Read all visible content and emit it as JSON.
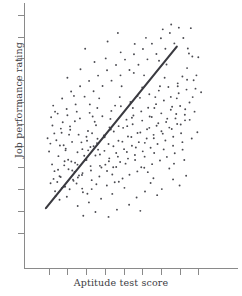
{
  "chart_data": {
    "type": "scatter",
    "title": "",
    "xlabel": "Aptitude test score",
    "ylabel": "Job performance rating",
    "grid": false,
    "legend": null,
    "xlim": [
      0,
      100
    ],
    "ylim": [
      0,
      100
    ],
    "xticks": [
      10,
      20,
      30,
      40,
      50,
      60,
      70,
      80,
      90
    ],
    "yticks": [
      8,
      17,
      26,
      35,
      44,
      53,
      62,
      71,
      80,
      89,
      98
    ],
    "xtick_labels": [],
    "ytick_labels": [],
    "n_points": 300,
    "correlation": 0.55,
    "trend_line": {
      "type": "linear-regression",
      "x_start": 8.5,
      "y_start": 18.1,
      "x_end": 78.5,
      "y_end": 84.9,
      "color": "#3a3a40"
    },
    "point_color": "#4a4a50",
    "axis_color": "#8a8a8a",
    "points": [
      [
        10.2,
        41.5
      ],
      [
        11.8,
        36.2
      ],
      [
        9.4,
        47.0
      ],
      [
        13.1,
        33.4
      ],
      [
        12.0,
        52.3
      ],
      [
        14.6,
        28.9
      ],
      [
        10.9,
        44.8
      ],
      [
        15.2,
        39.6
      ],
      [
        13.7,
        23.1
      ],
      [
        16.4,
        31.0
      ],
      [
        11.3,
        55.7
      ],
      [
        17.0,
        26.4
      ],
      [
        14.1,
        46.2
      ],
      [
        18.3,
        35.8
      ],
      [
        12.6,
        30.2
      ],
      [
        19.1,
        42.7
      ],
      [
        15.8,
        21.6
      ],
      [
        20.4,
        38.1
      ],
      [
        16.9,
        49.3
      ],
      [
        21.2,
        25.9
      ],
      [
        13.4,
        58.0
      ],
      [
        22.6,
        33.7
      ],
      [
        18.0,
        44.1
      ],
      [
        23.3,
        29.4
      ],
      [
        17.5,
        53.6
      ],
      [
        24.1,
        36.9
      ],
      [
        19.7,
        22.8
      ],
      [
        25.4,
        41.2
      ],
      [
        20.9,
        48.5
      ],
      [
        26.2,
        31.6
      ],
      [
        18.8,
        27.0
      ],
      [
        27.5,
        45.3
      ],
      [
        22.1,
        37.4
      ],
      [
        28.3,
        24.7
      ],
      [
        21.4,
        51.9
      ],
      [
        29.0,
        39.8
      ],
      [
        23.8,
        33.1
      ],
      [
        30.2,
        47.6
      ],
      [
        24.9,
        28.3
      ],
      [
        31.1,
        42.0
      ],
      [
        26.7,
        55.2
      ],
      [
        32.4,
        35.5
      ],
      [
        25.6,
        30.8
      ],
      [
        33.2,
        49.1
      ],
      [
        27.9,
        26.2
      ],
      [
        34.0,
        43.7
      ],
      [
        29.4,
        38.0
      ],
      [
        35.3,
        52.4
      ],
      [
        28.1,
        32.6
      ],
      [
        36.1,
        46.8
      ],
      [
        30.7,
        24.1
      ],
      [
        37.4,
        40.3
      ],
      [
        31.9,
        57.5
      ],
      [
        38.2,
        34.9
      ],
      [
        33.0,
        29.7
      ],
      [
        39.5,
        48.2
      ],
      [
        32.3,
        43.4
      ],
      [
        40.3,
        36.1
      ],
      [
        34.6,
        53.8
      ],
      [
        41.1,
        27.5
      ],
      [
        35.8,
        45.0
      ],
      [
        42.4,
        38.7
      ],
      [
        37.1,
        31.2
      ],
      [
        43.2,
        50.6
      ],
      [
        36.4,
        42.3
      ],
      [
        44.5,
        35.0
      ],
      [
        38.7,
        56.1
      ],
      [
        45.3,
        28.8
      ],
      [
        39.9,
        47.4
      ],
      [
        46.1,
        40.9
      ],
      [
        41.2,
        33.5
      ],
      [
        47.4,
        52.0
      ],
      [
        42.0,
        44.6
      ],
      [
        48.2,
        37.2
      ],
      [
        43.5,
        58.3
      ],
      [
        49.5,
        30.4
      ],
      [
        44.8,
        49.8
      ],
      [
        50.3,
        42.5
      ],
      [
        46.1,
        35.1
      ],
      [
        51.6,
        54.7
      ],
      [
        47.3,
        46.0
      ],
      [
        52.4,
        38.6
      ],
      [
        48.6,
        60.2
      ],
      [
        53.2,
        31.9
      ],
      [
        49.8,
        51.3
      ],
      [
        54.5,
        43.9
      ],
      [
        51.1,
        36.5
      ],
      [
        55.3,
        56.4
      ],
      [
        52.4,
        47.7
      ],
      [
        56.1,
        40.1
      ],
      [
        53.7,
        62.0
      ],
      [
        57.4,
        33.3
      ],
      [
        54.9,
        52.8
      ],
      [
        58.2,
        45.4
      ],
      [
        56.2,
        38.0
      ],
      [
        59.5,
        58.1
      ],
      [
        57.5,
        49.2
      ],
      [
        60.3,
        41.6
      ],
      [
        58.8,
        63.7
      ],
      [
        61.1,
        34.8
      ],
      [
        60.0,
        54.3
      ],
      [
        62.4,
        46.9
      ],
      [
        61.3,
        39.4
      ],
      [
        63.2,
        59.6
      ],
      [
        62.6,
        50.7
      ],
      [
        64.5,
        43.1
      ],
      [
        63.8,
        65.2
      ],
      [
        65.3,
        36.3
      ],
      [
        65.1,
        55.8
      ],
      [
        66.1,
        48.4
      ],
      [
        66.4,
        40.9
      ],
      [
        67.4,
        61.1
      ],
      [
        67.7,
        52.2
      ],
      [
        68.2,
        44.6
      ],
      [
        68.9,
        66.7
      ],
      [
        69.5,
        37.8
      ],
      [
        70.2,
        57.3
      ],
      [
        70.3,
        49.9
      ],
      [
        71.5,
        42.4
      ],
      [
        71.6,
        62.6
      ],
      [
        72.8,
        53.7
      ],
      [
        72.4,
        46.1
      ],
      [
        74.0,
        68.2
      ],
      [
        73.2,
        39.3
      ],
      [
        75.3,
        58.8
      ],
      [
        74.5,
        51.4
      ],
      [
        76.5,
        43.9
      ],
      [
        75.3,
        64.1
      ],
      [
        77.8,
        55.2
      ],
      [
        76.6,
        47.6
      ],
      [
        79.0,
        69.7
      ],
      [
        77.4,
        40.8
      ],
      [
        80.3,
        60.3
      ],
      [
        78.7,
        52.9
      ],
      [
        81.5,
        45.4
      ],
      [
        79.5,
        65.6
      ],
      [
        82.8,
        56.7
      ],
      [
        80.8,
        49.1
      ],
      [
        84.0,
        71.2
      ],
      [
        81.6,
        42.3
      ],
      [
        85.3,
        61.8
      ],
      [
        82.9,
        54.4
      ],
      [
        86.5,
        46.9
      ],
      [
        83.7,
        67.1
      ],
      [
        12.4,
        60.5
      ],
      [
        14.8,
        57.2
      ],
      [
        17.2,
        63.4
      ],
      [
        19.6,
        59.1
      ],
      [
        22.0,
        66.3
      ],
      [
        24.4,
        61.0
      ],
      [
        26.8,
        68.5
      ],
      [
        29.2,
        64.2
      ],
      [
        31.6,
        70.7
      ],
      [
        34.0,
        66.4
      ],
      [
        36.4,
        72.9
      ],
      [
        38.8,
        68.6
      ],
      [
        41.2,
        75.1
      ],
      [
        43.6,
        70.8
      ],
      [
        46.0,
        77.3
      ],
      [
        48.4,
        73.0
      ],
      [
        50.8,
        79.5
      ],
      [
        53.2,
        75.2
      ],
      [
        55.6,
        81.7
      ],
      [
        58.0,
        77.4
      ],
      [
        60.4,
        83.9
      ],
      [
        62.8,
        79.6
      ],
      [
        65.2,
        86.1
      ],
      [
        67.6,
        81.8
      ],
      [
        70.0,
        88.3
      ],
      [
        72.4,
        84.0
      ],
      [
        74.8,
        90.5
      ],
      [
        77.2,
        86.2
      ],
      [
        79.6,
        92.7
      ],
      [
        82.0,
        88.4
      ],
      [
        84.4,
        84.1
      ],
      [
        86.8,
        80.8
      ],
      [
        11.0,
        28.4
      ],
      [
        13.4,
        25.1
      ],
      [
        15.8,
        31.3
      ],
      [
        18.2,
        27.0
      ],
      [
        20.6,
        34.2
      ],
      [
        23.0,
        29.9
      ],
      [
        25.4,
        36.1
      ],
      [
        27.8,
        31.8
      ],
      [
        30.2,
        38.0
      ],
      [
        32.6,
        33.7
      ],
      [
        35.0,
        39.9
      ],
      [
        37.4,
        35.6
      ],
      [
        39.8,
        41.8
      ],
      [
        42.2,
        37.5
      ],
      [
        44.6,
        43.7
      ],
      [
        47.0,
        39.4
      ],
      [
        49.4,
        45.6
      ],
      [
        51.8,
        41.3
      ],
      [
        54.2,
        47.5
      ],
      [
        56.6,
        43.2
      ],
      [
        59.0,
        49.4
      ],
      [
        61.4,
        45.1
      ],
      [
        63.8,
        51.3
      ],
      [
        66.2,
        47.0
      ],
      [
        68.6,
        53.2
      ],
      [
        71.0,
        48.9
      ],
      [
        73.4,
        55.1
      ],
      [
        75.8,
        50.8
      ],
      [
        78.2,
        57.0
      ],
      [
        80.6,
        52.7
      ],
      [
        83.0,
        59.0
      ],
      [
        85.4,
        54.6
      ],
      [
        16.0,
        44.0
      ],
      [
        21.5,
        50.5
      ],
      [
        28.0,
        42.5
      ],
      [
        33.5,
        56.0
      ],
      [
        40.0,
        48.0
      ],
      [
        45.5,
        60.5
      ],
      [
        52.0,
        52.0
      ],
      [
        57.5,
        64.5
      ],
      [
        64.0,
        56.0
      ],
      [
        69.5,
        68.5
      ],
      [
        76.0,
        60.0
      ],
      [
        81.5,
        72.5
      ],
      [
        87.0,
        64.0
      ],
      [
        18.5,
        37.5
      ],
      [
        24.0,
        54.0
      ],
      [
        30.5,
        46.0
      ],
      [
        36.0,
        59.5
      ],
      [
        42.5,
        51.5
      ],
      [
        48.0,
        64.0
      ],
      [
        54.5,
        55.5
      ],
      [
        60.0,
        68.0
      ],
      [
        66.5,
        59.5
      ],
      [
        72.0,
        72.0
      ],
      [
        78.5,
        63.5
      ],
      [
        84.0,
        76.0
      ],
      [
        88.5,
        67.5
      ],
      [
        13.0,
        49.0
      ],
      [
        19.0,
        42.0
      ],
      [
        25.0,
        58.0
      ],
      [
        31.0,
        50.0
      ],
      [
        37.0,
        63.5
      ],
      [
        43.0,
        55.0
      ],
      [
        49.0,
        68.5
      ],
      [
        55.0,
        59.5
      ],
      [
        61.0,
        73.0
      ],
      [
        67.0,
        64.0
      ],
      [
        73.0,
        77.5
      ],
      [
        79.0,
        68.5
      ],
      [
        85.0,
        82.0
      ],
      [
        89.0,
        73.0
      ],
      [
        15.0,
        34.0
      ],
      [
        23.5,
        64.5
      ],
      [
        35.5,
        28.0
      ],
      [
        44.0,
        32.0
      ],
      [
        59.5,
        35.0
      ],
      [
        66.0,
        30.5
      ],
      [
        74.5,
        34.5
      ],
      [
        82.5,
        38.0
      ],
      [
        20.0,
        72.0
      ],
      [
        27.0,
        75.5
      ],
      [
        33.0,
        26.0
      ],
      [
        40.5,
        80.0
      ],
      [
        47.5,
        29.0
      ],
      [
        56.0,
        86.0
      ],
      [
        63.0,
        33.0
      ],
      [
        71.0,
        92.0
      ],
      [
        77.0,
        36.5
      ],
      [
        86.0,
        92.5
      ],
      [
        88.0,
        58.0
      ],
      [
        90.0,
        80.5
      ],
      [
        91.5,
        66.0
      ],
      [
        89.5,
        49.5
      ],
      [
        87.5,
        71.0
      ],
      [
        44.0,
        24.0
      ],
      [
        50.5,
        26.5
      ],
      [
        57.0,
        22.5
      ],
      [
        38.0,
        22.0
      ],
      [
        31.5,
        20.5
      ],
      [
        25.5,
        19.0
      ],
      [
        61.5,
        25.0
      ],
      [
        68.0,
        23.5
      ],
      [
        53.0,
        19.5
      ],
      [
        46.5,
        17.5
      ],
      [
        64.5,
        28.5
      ],
      [
        70.5,
        26.0
      ],
      [
        59.0,
        17.0
      ],
      [
        76.5,
        30.0
      ],
      [
        83.5,
        31.5
      ],
      [
        80.0,
        27.5
      ],
      [
        35.0,
        16.5
      ],
      [
        28.5,
        15.0
      ],
      [
        42.0,
        14.5
      ],
      [
        22.5,
        45.5
      ],
      [
        16.5,
        51.0
      ],
      [
        20.0,
        56.5
      ],
      [
        26.0,
        48.5
      ],
      [
        32.0,
        61.0
      ],
      [
        48.5,
        82.5
      ],
      [
        55.5,
        74.0
      ],
      [
        62.0,
        88.5
      ],
      [
        69.0,
        79.0
      ],
      [
        75.5,
        94.0
      ],
      [
        41.5,
        87.0
      ],
      [
        34.5,
        78.5
      ],
      [
        29.5,
        84.0
      ],
      [
        47.0,
        90.5
      ]
    ]
  },
  "figure": {
    "background": "#ffffff",
    "width": 242,
    "height": 296
  }
}
